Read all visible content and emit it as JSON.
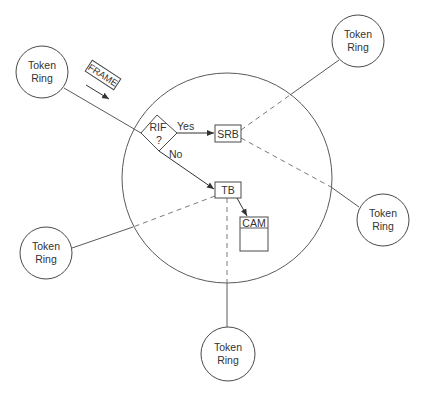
{
  "diagram": {
    "type": "network-bridge-flow",
    "colors": {
      "line": "#5a5a5a",
      "text": "#333333",
      "background": "#ffffff"
    },
    "token_rings": [
      {
        "id": "ring-top-left",
        "label_line1": "Token",
        "label_line2": "Ring"
      },
      {
        "id": "ring-top-right",
        "label_line1": "Token",
        "label_line2": "Ring"
      },
      {
        "id": "ring-right",
        "label_line1": "Token",
        "label_line2": "Ring"
      },
      {
        "id": "ring-bottom-left",
        "label_line1": "Token",
        "label_line2": "Ring"
      },
      {
        "id": "ring-bottom",
        "label_line1": "Token",
        "label_line2": "Ring"
      }
    ],
    "frame_label": "FRAME",
    "decision": {
      "label_line1": "RIF",
      "label_line2": "?",
      "yes_label": "Yes",
      "no_label": "No"
    },
    "nodes": {
      "srb": "SRB",
      "tb": "TB",
      "cam": "CAM"
    }
  }
}
